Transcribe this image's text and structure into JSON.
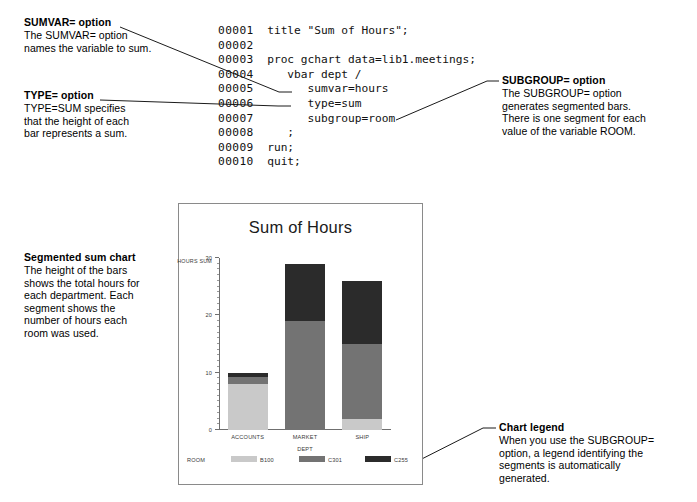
{
  "annotations": {
    "sumvar": {
      "title": "SUMVAR= option",
      "lines": [
        "The SUMVAR= option",
        "names the variable to sum."
      ]
    },
    "type": {
      "title": "TYPE= option",
      "lines": [
        "TYPE=SUM specifies",
        "that the height of each",
        "bar represents a sum."
      ]
    },
    "subgroup": {
      "title": "SUBGROUP= option",
      "lines": [
        "The SUBGROUP= option",
        "generates segmented bars.",
        "There is one segment for each",
        "value of the variable ROOM."
      ]
    },
    "segmented": {
      "title": "Segmented sum chart",
      "lines": [
        "The height of the bars",
        "shows the total hours for",
        "each department. Each",
        "segment shows the",
        "number of hours each",
        "room was used."
      ]
    },
    "legend": {
      "title": "Chart legend",
      "lines": [
        "When you use the SUBGROUP=",
        "option, a legend identifying the",
        "segments is automatically",
        "generated."
      ]
    }
  },
  "code": {
    "lines": [
      {
        "num": "00001",
        "text": "title \"Sum of Hours\";"
      },
      {
        "num": "00002",
        "text": ""
      },
      {
        "num": "00003",
        "text": "proc gchart data=lib1.meetings;"
      },
      {
        "num": "00004",
        "text": "   vbar dept /"
      },
      {
        "num": "00005",
        "text": "      sumvar=hours"
      },
      {
        "num": "00006",
        "text": "      type=sum"
      },
      {
        "num": "00007",
        "text": "      subgroup=room"
      },
      {
        "num": "00008",
        "text": "   ;"
      },
      {
        "num": "00009",
        "text": "run;"
      },
      {
        "num": "00010",
        "text": "quit;"
      }
    ]
  },
  "chart_data": {
    "type": "bar",
    "stacked": true,
    "title": "Sum of Hours",
    "xlabel": "DEPT",
    "ylabel": "HOURS SUM",
    "categories": [
      "ACCOUNTS",
      "MARKET",
      "SHIP"
    ],
    "ylim": [
      0,
      30
    ],
    "yticks": [
      "0",
      "10",
      "20",
      "30"
    ],
    "ytick_values": [
      0,
      10,
      20,
      30
    ],
    "grid": false,
    "legend_title": "ROOM",
    "legend_position": "bottom",
    "series": [
      {
        "name": "B100",
        "color": "#c9c9c9",
        "values": [
          8,
          0,
          2
        ]
      },
      {
        "name": "C301",
        "color": "#737373",
        "values": [
          1.2,
          19,
          13
        ]
      },
      {
        "name": "C255",
        "color": "#2b2b2b",
        "values": [
          0.8,
          10,
          11
        ]
      }
    ],
    "totals": [
      10,
      29,
      26
    ]
  }
}
